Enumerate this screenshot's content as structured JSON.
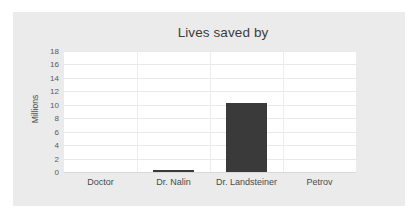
{
  "chart_data": {
    "type": "bar",
    "title": "Lives saved by",
    "xlabel": "",
    "ylabel": "Millions",
    "categories": [
      "Doctor",
      "Dr. Nalin",
      "Dr. Landsteiner",
      "Petrov"
    ],
    "values": [
      0,
      0.3,
      10.2,
      0
    ],
    "ylim": [
      0,
      18
    ],
    "yticks": [
      0,
      2,
      4,
      6,
      8,
      10,
      12,
      14,
      16,
      18
    ],
    "ytick_labels": [
      "0",
      "2",
      "4",
      "6",
      "8",
      "10",
      "12",
      "14",
      "16",
      "18"
    ],
    "grid": true,
    "legend": false,
    "series": [
      {
        "name": "Lives saved",
        "values": [
          0,
          0.3,
          10.2,
          0
        ]
      }
    ],
    "colors": {
      "bar": "#3a3a3a",
      "card_background": "#ebebeb",
      "plot_background": "#ffffff",
      "gridline": "#e8e8e8",
      "title_text": "#3c3c3c",
      "tick_text": "#4a4a4a"
    }
  }
}
